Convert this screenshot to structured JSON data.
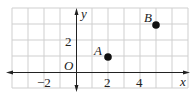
{
  "diagram": {
    "type": "coordinate-plane",
    "grid": {
      "x_min": -4,
      "x_max": 7,
      "y_min": -1,
      "y_max": 4,
      "unit_px": 16,
      "origin_px": [
        76,
        72
      ]
    },
    "axes": {
      "x_label": "x",
      "y_label": "y",
      "origin_label": "O"
    },
    "x_tick_labels": [
      {
        "value": -2,
        "text": "−2"
      },
      {
        "value": 2,
        "text": "2"
      },
      {
        "value": 4,
        "text": "4"
      }
    ],
    "y_tick_labels": [
      {
        "value": 2,
        "text": "2"
      }
    ],
    "points": [
      {
        "name": "A",
        "x": 2,
        "y": 1
      },
      {
        "name": "B",
        "x": 5,
        "y": 3
      }
    ],
    "colors": {
      "grid": "#cfcfcf",
      "axis": "#222222",
      "point": "#111111",
      "background": "#ffffff"
    }
  }
}
